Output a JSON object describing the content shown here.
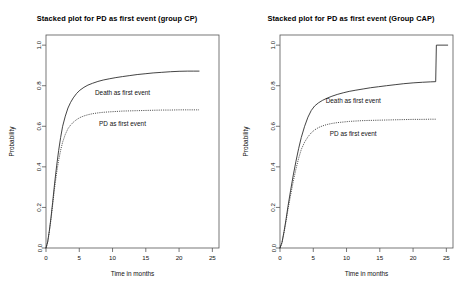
{
  "figure": {
    "width": 468,
    "height": 296,
    "background": "#ffffff"
  },
  "chart_data": [
    {
      "type": "line",
      "panel": "left",
      "title": "Stacked plot for PD as first event (group CP)",
      "xlabel": "Time in months",
      "ylabel": "Probability",
      "xlim": [
        0,
        26
      ],
      "ylim": [
        0,
        1.05
      ],
      "xticks": [
        0,
        5,
        10,
        15,
        20,
        25
      ],
      "xticklabels": [
        "0",
        "5",
        "10",
        "15",
        "20",
        "25"
      ],
      "yticks": [
        0.0,
        0.2,
        0.4,
        0.6,
        0.8,
        1.0
      ],
      "yticklabels": [
        "0.0",
        "0.2",
        "0.4",
        "0.6",
        "0.8",
        "1.0"
      ],
      "grid": false,
      "legend_position": "inline-annotation",
      "annotations": [
        {
          "text": "Death as first event",
          "x": 11.5,
          "y": 0.755
        },
        {
          "text": "PD as first event",
          "x": 11.5,
          "y": 0.6
        }
      ],
      "series": [
        {
          "name": "Death as first event",
          "style": "solid",
          "color": "#222222",
          "x": [
            0.0,
            0.25,
            0.5,
            0.75,
            1.0,
            1.3,
            1.6,
            1.9,
            2.2,
            2.5,
            2.9,
            3.3,
            3.7,
            4.1,
            4.6,
            5.1,
            5.7,
            6.3,
            7.0,
            7.8,
            8.6,
            9.5,
            10.5,
            11.5,
            12.6,
            13.7,
            14.9,
            16.1,
            17.4,
            18.7,
            20.0,
            21.3,
            22.2,
            23.0
          ],
          "y": [
            0.0,
            0.03,
            0.085,
            0.15,
            0.225,
            0.32,
            0.405,
            0.48,
            0.545,
            0.6,
            0.65,
            0.69,
            0.718,
            0.74,
            0.762,
            0.778,
            0.792,
            0.803,
            0.812,
            0.821,
            0.828,
            0.834,
            0.84,
            0.845,
            0.85,
            0.855,
            0.859,
            0.863,
            0.866,
            0.869,
            0.871,
            0.872,
            0.872,
            0.872
          ]
        },
        {
          "name": "PD as first event",
          "style": "dotted",
          "color": "#333333",
          "x": [
            0.0,
            0.25,
            0.5,
            0.75,
            1.0,
            1.3,
            1.6,
            1.9,
            2.2,
            2.5,
            2.9,
            3.3,
            3.7,
            4.1,
            4.6,
            5.1,
            5.7,
            6.3,
            7.0,
            7.8,
            8.6,
            9.5,
            10.5,
            11.5,
            12.6,
            13.7,
            14.9,
            16.1,
            17.4,
            18.7,
            20.0,
            21.3,
            22.2,
            23.0
          ],
          "y": [
            0.0,
            0.028,
            0.08,
            0.142,
            0.212,
            0.298,
            0.372,
            0.432,
            0.482,
            0.522,
            0.56,
            0.588,
            0.606,
            0.62,
            0.633,
            0.643,
            0.651,
            0.657,
            0.662,
            0.666,
            0.669,
            0.671,
            0.673,
            0.675,
            0.676,
            0.677,
            0.678,
            0.679,
            0.68,
            0.68,
            0.681,
            0.681,
            0.681,
            0.681
          ]
        }
      ]
    },
    {
      "type": "line",
      "panel": "right",
      "title": "Stacked plot for PD as first event (Group CAP)",
      "xlabel": "Time in months",
      "ylabel": "Probability",
      "xlim": [
        0,
        26
      ],
      "ylim": [
        0,
        1.05
      ],
      "xticks": [
        0,
        5,
        10,
        15,
        20,
        25
      ],
      "xticklabels": [
        "0",
        "5",
        "10",
        "15",
        "20",
        "25"
      ],
      "yticks": [
        0.0,
        0.2,
        0.4,
        0.6,
        0.8,
        1.0
      ],
      "yticklabels": [
        "0.0",
        "0.2",
        "0.4",
        "0.6",
        "0.8",
        "1.0"
      ],
      "grid": false,
      "legend_position": "inline-annotation",
      "annotations": [
        {
          "text": "Death as first event",
          "x": 11.0,
          "y": 0.715
        },
        {
          "text": "PD as first event",
          "x": 11.0,
          "y": 0.552
        }
      ],
      "series": [
        {
          "name": "Death as first event",
          "style": "solid",
          "color": "#222222",
          "x": [
            0.0,
            0.3,
            0.6,
            0.9,
            1.2,
            1.6,
            2.0,
            2.4,
            2.8,
            3.2,
            3.7,
            4.2,
            4.7,
            5.2,
            5.8,
            6.4,
            7.1,
            7.8,
            8.6,
            9.5,
            10.4,
            11.4,
            12.5,
            13.6,
            14.8,
            16.0,
            17.3,
            18.6,
            20.0,
            21.4,
            22.6,
            23.4,
            23.5,
            25.2
          ],
          "y": [
            0.0,
            0.028,
            0.08,
            0.14,
            0.205,
            0.285,
            0.36,
            0.428,
            0.49,
            0.545,
            0.6,
            0.645,
            0.678,
            0.7,
            0.716,
            0.728,
            0.739,
            0.748,
            0.757,
            0.765,
            0.772,
            0.778,
            0.784,
            0.79,
            0.795,
            0.8,
            0.805,
            0.81,
            0.814,
            0.817,
            0.819,
            0.82,
            1.0,
            1.0
          ]
        },
        {
          "name": "PD as first event",
          "style": "dotted",
          "color": "#333333",
          "x": [
            0.0,
            0.3,
            0.6,
            0.9,
            1.2,
            1.6,
            2.0,
            2.4,
            2.8,
            3.2,
            3.7,
            4.2,
            4.7,
            5.2,
            5.8,
            6.4,
            7.1,
            7.8,
            8.6,
            9.5,
            10.4,
            11.4,
            12.5,
            13.6,
            14.8,
            16.0,
            17.3,
            18.6,
            20.0,
            21.4,
            22.6,
            23.4
          ],
          "y": [
            0.0,
            0.026,
            0.075,
            0.13,
            0.19,
            0.262,
            0.33,
            0.39,
            0.442,
            0.486,
            0.522,
            0.548,
            0.568,
            0.582,
            0.594,
            0.602,
            0.609,
            0.614,
            0.618,
            0.621,
            0.624,
            0.626,
            0.628,
            0.629,
            0.63,
            0.631,
            0.632,
            0.633,
            0.634,
            0.634,
            0.635,
            0.635
          ]
        }
      ]
    }
  ]
}
